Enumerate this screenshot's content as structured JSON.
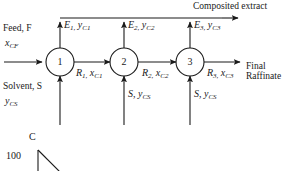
{
  "diagram": {
    "type": "three-stage-countercurrent-extraction-flowsheet",
    "header": {
      "composited_extract_label": "Composited extract"
    },
    "inlets": {
      "feed_label": "Feed, F",
      "feed_composition": "x",
      "feed_composition_sub": "CF",
      "solvent_label": "Solvent, S",
      "solvent_composition": "y",
      "solvent_composition_sub": "CS"
    },
    "outlets": {
      "raffinate_line1": "Final",
      "raffinate_line2": "Raffinate"
    },
    "stages": [
      {
        "number": "1",
        "extract_symbol": "E",
        "extract_sub": "1,",
        "extract_comp": "y",
        "extract_comp_sub": "C1",
        "raffinate_symbol": "R",
        "raffinate_sub": "1,",
        "raffinate_comp": "x",
        "raffinate_comp_sub": "C1",
        "solvent_symbol": "S,",
        "solvent_comp": "y",
        "solvent_comp_sub": "CS",
        "solvent_shown": false
      },
      {
        "number": "2",
        "extract_symbol": "E",
        "extract_sub": "2,",
        "extract_comp": "y",
        "extract_comp_sub": "C2",
        "raffinate_symbol": "R",
        "raffinate_sub": "2,",
        "raffinate_comp": "x",
        "raffinate_comp_sub": "C2",
        "solvent_symbol": "S,",
        "solvent_comp": "y",
        "solvent_comp_sub": "CS",
        "solvent_shown": true
      },
      {
        "number": "3",
        "extract_symbol": "E",
        "extract_sub": "3,",
        "extract_comp": "y",
        "extract_comp_sub": "C3",
        "raffinate_symbol": "R",
        "raffinate_sub": "3,",
        "raffinate_comp": "x",
        "raffinate_comp_sub": "C3",
        "solvent_symbol": "S,",
        "solvent_comp": "y",
        "solvent_comp_sub": "CS",
        "solvent_shown": true
      }
    ],
    "ternary_fragment": {
      "apex_label": "C",
      "axis_value": "100"
    },
    "colors": {
      "line": "#1a1a1a",
      "text": "#1a1a1a",
      "background": "#ffffff"
    }
  }
}
